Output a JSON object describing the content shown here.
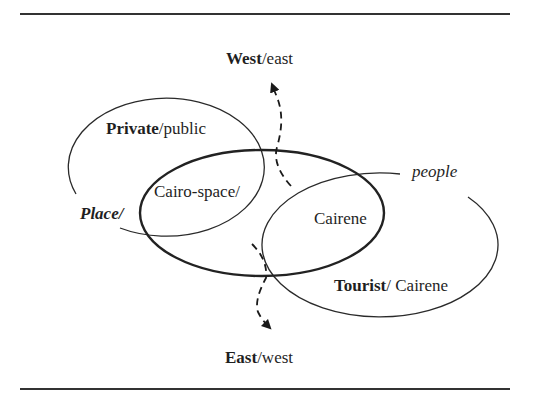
{
  "figure": {
    "type": "overlapping-ellipses-diagram",
    "colors": {
      "stroke": "#2a2a2a",
      "text": "#1f1f1f",
      "rule": "#333333",
      "background": "#ffffff"
    },
    "labels": {
      "west_east": {
        "strong": "West",
        "rest": "/east"
      },
      "private_public": {
        "strong": "Private",
        "rest": "/public"
      },
      "cairo_space": {
        "text": "Cairo-space/"
      },
      "place": {
        "text": "Place/"
      },
      "people": {
        "text": "people"
      },
      "cairene_center": {
        "text": "Cairene"
      },
      "tourist_cairene": {
        "strong": "Tourist",
        "rest": "/ Cairene"
      },
      "east_west": {
        "strong": "East",
        "rest": "/west"
      }
    },
    "shapes": {
      "left_ellipse": "Place / Private-public set",
      "center_ellipse": "Cairo-space set (thick)",
      "right_ellipse": "People / Tourist-Cairene set",
      "arrow_up": "dashed arrow toward West/east",
      "arrow_down": "dashed arrow toward East/west"
    }
  }
}
